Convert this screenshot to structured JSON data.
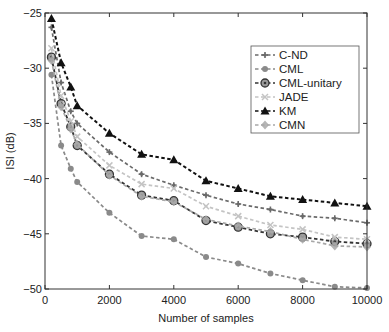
{
  "chart_data": {
    "type": "line",
    "title": "",
    "xlabel": "Number of samples",
    "ylabel": "ISI (dB)",
    "xlim": [
      0,
      10000
    ],
    "ylim": [
      -50,
      -25
    ],
    "xticks": [
      0,
      2000,
      4000,
      6000,
      8000,
      10000
    ],
    "yticks": [
      -25,
      -30,
      -35,
      -40,
      -45,
      -50
    ],
    "grid": false,
    "legend_position": "upper right",
    "x": [
      200,
      500,
      800,
      1000,
      2000,
      3000,
      4000,
      5000,
      6000,
      7000,
      8000,
      9000,
      10000
    ],
    "series": [
      {
        "name": "C-ND",
        "marker": "plus",
        "color": "#6a6a6a",
        "line_style": "dashed",
        "values": [
          -26.3,
          -31.3,
          -33.9,
          -35.0,
          -37.6,
          -39.6,
          -40.6,
          -41.5,
          -42.3,
          -42.8,
          -43.4,
          -43.6,
          -44.0
        ]
      },
      {
        "name": "CML",
        "marker": "dot",
        "color": "#8a8a8a",
        "line_style": "dashed",
        "values": [
          -30.6,
          -37.0,
          -39.1,
          -40.3,
          -43.1,
          -45.2,
          -45.5,
          -47.1,
          -47.7,
          -48.6,
          -49.2,
          -49.8,
          -49.9
        ]
      },
      {
        "name": "CML-unitary",
        "marker": "circle-dot",
        "color": "#333333",
        "line_style": "dashed",
        "values": [
          -29.0,
          -33.2,
          -35.3,
          -37.0,
          -39.6,
          -41.5,
          -42.0,
          -43.8,
          -44.4,
          -45.0,
          -45.3,
          -45.7,
          -45.9
        ]
      },
      {
        "name": "JADE",
        "marker": "x",
        "color": "#c4c4c4",
        "line_style": "dashed",
        "values": [
          -28.2,
          -32.5,
          -34.8,
          -36.2,
          -38.8,
          -40.5,
          -40.9,
          -42.5,
          -43.4,
          -44.2,
          -44.6,
          -45.3,
          -45.5
        ]
      },
      {
        "name": "KM",
        "marker": "triangle",
        "color": "#111111",
        "line_style": "dashed",
        "values": [
          -25.5,
          -29.5,
          -31.7,
          -33.4,
          -35.9,
          -37.8,
          -38.3,
          -40.2,
          -40.9,
          -41.6,
          -41.9,
          -42.2,
          -42.5
        ]
      },
      {
        "name": "CMN",
        "marker": "diamond",
        "color": "#a8a8a8",
        "line_style": "dashed",
        "values": [
          -29.3,
          -33.5,
          -35.5,
          -36.9,
          -39.7,
          -41.6,
          -42.1,
          -43.7,
          -44.3,
          -44.8,
          -45.5,
          -46.1,
          -46.2
        ]
      }
    ]
  },
  "labels": {
    "xlabel": "Number of samples",
    "ylabel": "ISI (dB)",
    "xtick_labels": [
      "0",
      "2000",
      "4000",
      "6000",
      "8000",
      "10000"
    ],
    "ytick_labels": [
      "-25",
      "-30",
      "-35",
      "-40",
      "-45",
      "-50"
    ],
    "legend": [
      "C-ND",
      "CML",
      "CML-unitary",
      "JADE",
      "KM",
      "CMN"
    ]
  }
}
